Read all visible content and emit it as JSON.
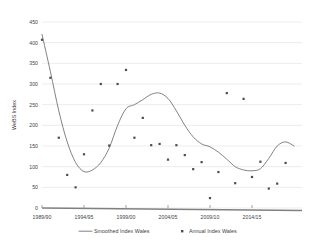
{
  "chart_data": {
    "type": "line",
    "title": "",
    "xlabel": "",
    "ylabel": "WeBS Index",
    "ylim": [
      0,
      450
    ],
    "ytick_values": [
      0,
      50,
      100,
      150,
      200,
      250,
      300,
      350,
      400,
      450
    ],
    "ytick_labels": [
      "0",
      "50",
      "100",
      "150",
      "200",
      "250",
      "300",
      "350",
      "400",
      "450"
    ],
    "xtick_labels": [
      "1989/90",
      "1994/95",
      "1999/00",
      "2004/05",
      "2009/10",
      "2014/15"
    ],
    "xtick_years": [
      1989,
      1994,
      1999,
      2004,
      2009,
      2014
    ],
    "xlim": [
      1989,
      2017
    ],
    "grid": "horizontal",
    "legend_position": "bottom",
    "colors": {
      "line": "#6b6b6b",
      "marker": "#4d4d4d",
      "grid": "#d9d9d9",
      "axis": "#808080",
      "text": "#3f3f3f",
      "background": "#ffffff"
    },
    "series": [
      {
        "name": "Smoothed Index Wales",
        "type": "line",
        "x": [
          1989,
          1990,
          1991,
          1992,
          1993,
          1994,
          1995,
          1996,
          1997,
          1998,
          1999,
          2000,
          2001,
          2002,
          2003,
          2004,
          2005,
          2006,
          2007,
          2008,
          2009,
          2010,
          2011,
          2012,
          2013,
          2014,
          2015,
          2016,
          2017
        ],
        "values": [
          420,
          330,
          235,
          160,
          110,
          88,
          92,
          110,
          145,
          200,
          240,
          250,
          262,
          275,
          278,
          265,
          235,
          200,
          172,
          155,
          148,
          135,
          118,
          100,
          92,
          90,
          95,
          120,
          150
        ]
      },
      {
        "name": "Annual Index Wales",
        "type": "scatter",
        "x": [
          1989,
          1990,
          1991,
          1992,
          1993,
          1994,
          1995,
          1996,
          1997,
          1998,
          1999,
          2000,
          2001,
          2002,
          2003,
          2004,
          2005,
          2006,
          2007,
          2008,
          2009,
          2010,
          2011,
          2012,
          2013,
          2014,
          2015,
          2016,
          2017
        ],
        "values": [
          407,
          315,
          170,
          80,
          50,
          130,
          236,
          300,
          151,
          300,
          334,
          170,
          218,
          152,
          155,
          117,
          152,
          128,
          94,
          111,
          24,
          87,
          278,
          60,
          264,
          75,
          112,
          47,
          59
        ]
      }
    ],
    "smoothed_extra": {
      "x": [
        2018,
        2019
      ],
      "values": [
        160,
        150
      ]
    },
    "annual_extra": {
      "x": [
        2018
      ],
      "values": [
        109
      ]
    },
    "legend": [
      {
        "label": "Smoothed Index Wales",
        "marker": "line",
        "color": "#6b6b6b"
      },
      {
        "label": "Annual Index Wales",
        "marker": "square",
        "color": "#4d4d4d"
      }
    ]
  }
}
